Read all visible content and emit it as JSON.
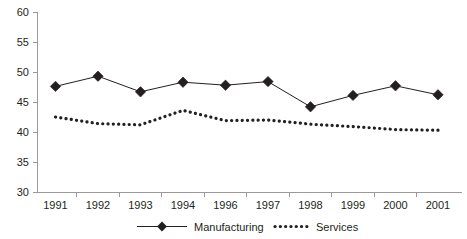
{
  "chart_data": {
    "type": "line",
    "title": "",
    "xlabel": "",
    "ylabel": "",
    "categories": [
      "1991",
      "1992",
      "1993",
      "1994",
      "1996",
      "1997",
      "1998",
      "1999",
      "2000",
      "2001"
    ],
    "series": [
      {
        "name": "Manufacturing",
        "style": "solid-line-with-diamond-markers",
        "color": "#231f20",
        "values": [
          47.6,
          49.3,
          46.7,
          48.3,
          47.8,
          48.4,
          44.2,
          46.1,
          47.7,
          46.2
        ]
      },
      {
        "name": "Services",
        "style": "dotted-line",
        "color": "#231f20",
        "values": [
          42.5,
          41.4,
          41.2,
          43.6,
          41.9,
          42.0,
          41.3,
          40.9,
          40.4,
          40.3
        ]
      }
    ],
    "ylim": [
      30,
      60
    ],
    "ytick_step": 5,
    "yticks": [
      "60",
      "55",
      "50",
      "45",
      "40",
      "35",
      "30"
    ],
    "grid": false,
    "legend_position": "bottom",
    "legend": [
      "Manufacturing",
      "Services"
    ],
    "axis_color": "#9a9a9a"
  }
}
